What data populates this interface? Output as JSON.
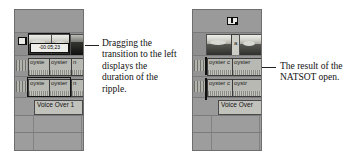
{
  "figure": {
    "panels": [
      {
        "id": "left",
        "name": "before-panel",
        "cursor_icon": "ripple-edit-cursor-icon",
        "tooltip": "-00:05;23",
        "video_track": {
          "clips": [
            {
              "label": "",
              "kind": "thumbnail"
            },
            {
              "label": "",
              "kind": "thumbnail"
            },
            {
              "label": "",
              "kind": "thumbnail-dark"
            }
          ]
        },
        "audio_tracks": [
          {
            "clips": [
              "oyste",
              "oyster",
              "n"
            ]
          },
          {
            "clips": [
              "oyste",
              "oyster",
              "n"
            ]
          }
        ],
        "voiceover": {
          "label": "Voice Over 1"
        },
        "caption": "Dragging the transition to the left displays the duration of the ripple."
      },
      {
        "id": "right",
        "name": "after-panel",
        "cursor_icon": "selection-tool-icon",
        "tooltip": "",
        "video_track": {
          "clips": [
            {
              "label": "",
              "kind": "thumbnail"
            },
            {
              "label": "a",
              "kind": "transition"
            },
            {
              "label": "",
              "kind": "thumbnail-dark"
            }
          ]
        },
        "audio_tracks": [
          {
            "clips": [
              "oyster c",
              "oyster"
            ]
          },
          {
            "clips": [
              "oyster c",
              "oystr"
            ]
          }
        ],
        "voiceover": {
          "label": "Voice Over"
        },
        "caption": "The result of the NATSOT open."
      }
    ]
  },
  "colors": {
    "panel_bg": "#9d9d9d",
    "panel_border": "#6e6e6e",
    "clip_fill": "#b9b9b4",
    "clip_border": "#3c3c3c",
    "text": "#111111"
  }
}
